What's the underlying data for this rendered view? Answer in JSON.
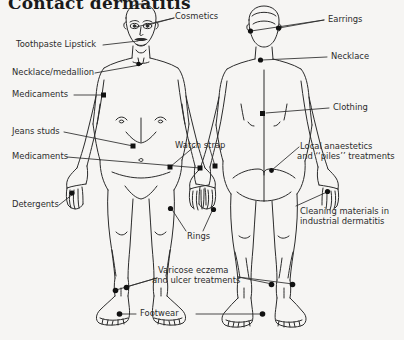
{
  "figure": {
    "title": "Contact dermatitis",
    "type": "annotated-anatomical-diagram",
    "background_color": "#f6f5f3",
    "ink_color": "#2b2b2b",
    "marker_color": "#111111"
  },
  "labels": {
    "cosmetics": "Cosmetics",
    "toothpaste_lipstick": "Toothpaste  Lipstick",
    "necklace_medallion": "Necklace/medallion",
    "medicaments_upper": "Medicaments",
    "jeans_studs": "Jeans studs",
    "medicaments_lower": "Medicaments",
    "detergents": "Detergents",
    "watch_strap": "Watch strap",
    "rings": "Rings",
    "varicose_line1": "Varicose eczema",
    "varicose_line2": "and ulcer treatments",
    "footwear": "Footwear",
    "earrings": "Earrings",
    "necklace": "Necklace",
    "clothing": "Clothing",
    "local_line1": "Local anaestetics",
    "local_line2": "and ‘‘piles’’ treatments",
    "cleaning_line1": "Cleaning materials in",
    "cleaning_line2": "industrial dermatitis"
  }
}
